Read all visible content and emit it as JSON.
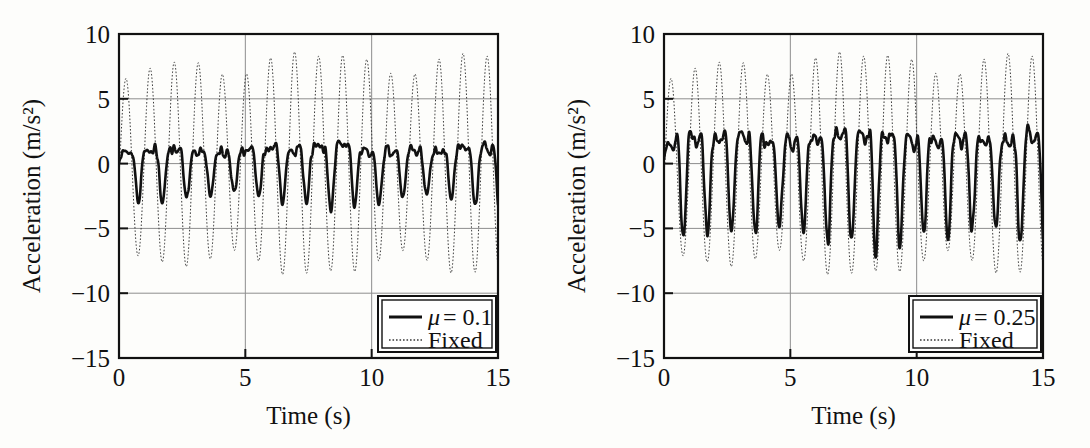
{
  "figure": {
    "background_color": "#fdfdfb",
    "ink_color": "#111111",
    "grid_color": "#8d8d8d",
    "panel_count": 2
  },
  "chart_data": [
    {
      "type": "line",
      "panel": "left",
      "title": "",
      "xlabel": "Time (s)",
      "ylabel": "Acceleration (m/s²)",
      "xlim": [
        0,
        15
      ],
      "ylim": [
        -15,
        10
      ],
      "xticks": [
        0,
        5,
        10,
        15
      ],
      "xtick_labels": [
        "0",
        "5",
        "10",
        "15"
      ],
      "yticks": [
        -15,
        -10,
        -5,
        0,
        5,
        10
      ],
      "ytick_labels": [
        "−15",
        "−10",
        "−5",
        "0",
        "5",
        "10"
      ],
      "grid": true,
      "grid_axes": "both",
      "legend_position": "lower right",
      "series": [
        {
          "name": "μ = 0.1",
          "label_prefix": "μ",
          "label_suffix": "= 0.1",
          "style": "solid",
          "linewidth": 2.6,
          "color": "#111111",
          "description": "Isolated (friction pendulum, mu=0.1) deck acceleration: low-amplitude harmonic-rich response",
          "amplitude": 3.0,
          "mean_abs_peak": 2.6,
          "max_peak": 3.4,
          "min_peak": -3.3,
          "dominant_frequency_hz": 1.05,
          "harmonic_frequency_hz": 2.1,
          "harmonic_ratio": 0.55,
          "noise_level": 0.45,
          "phase": 0.0,
          "transient_start": 1.6,
          "transient_decay": 0.9
        },
        {
          "name": "Fixed",
          "style": "dotted",
          "linewidth": 1.0,
          "color": "#3a3a3a",
          "description": "Fixed-base deck acceleration: near-sinusoidal 8 m/s^2 response with initial -10.8 transient",
          "amplitude": 7.9,
          "max_peak": 9.3,
          "min_peak": -10.8,
          "steady_peak": 7.9,
          "dominant_frequency_hz": 1.05,
          "phase": 0.0,
          "transient_start": 3.0,
          "transient_decay": 1.1
        }
      ]
    },
    {
      "type": "line",
      "panel": "right",
      "title": "",
      "xlabel": "Time (s)",
      "ylabel": "Acceleration (m/s²)",
      "xlim": [
        0,
        15
      ],
      "ylim": [
        -15,
        10
      ],
      "xticks": [
        0,
        5,
        10,
        15
      ],
      "xtick_labels": [
        "0",
        "5",
        "10",
        "15"
      ],
      "yticks": [
        -15,
        -10,
        -5,
        0,
        5,
        10
      ],
      "ytick_labels": [
        "−15",
        "−10",
        "−5",
        "0",
        "5",
        "10"
      ],
      "grid": true,
      "grid_axes": "both",
      "legend_position": "lower right",
      "series": [
        {
          "name": "μ = 0.25",
          "label_prefix": "μ",
          "label_suffix": "= 0.25",
          "style": "solid",
          "linewidth": 2.6,
          "color": "#111111",
          "description": "Isolated (friction pendulum, mu=0.25) deck acceleration: larger amplitude, strongly clipped/harmonic response",
          "amplitude": 5.8,
          "mean_abs_peak": 5.4,
          "max_peak": 6.6,
          "min_peak": -6.2,
          "dominant_frequency_hz": 1.05,
          "harmonic_frequency_hz": 2.1,
          "harmonic_ratio": 0.62,
          "noise_level": 0.55,
          "phase": 0.0,
          "transient_start": 2.2,
          "transient_decay": 0.9
        },
        {
          "name": "Fixed",
          "style": "dotted",
          "linewidth": 1.0,
          "color": "#3a3a3a",
          "description": "Fixed-base deck acceleration: near-sinusoidal 8 m/s^2 response with initial -10.8 transient",
          "amplitude": 7.9,
          "max_peak": 9.3,
          "min_peak": -10.8,
          "steady_peak": 7.9,
          "dominant_frequency_hz": 1.05,
          "phase": 0.0,
          "transient_start": 3.0,
          "transient_decay": 1.1
        }
      ]
    }
  ]
}
